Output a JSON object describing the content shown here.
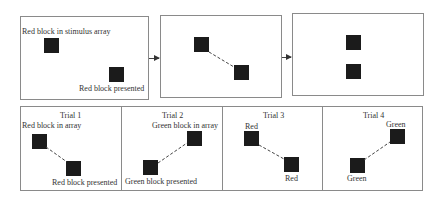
{
  "top_row": {
    "panels": [
      {
        "id": "stimulus-array",
        "labels": [
          "Red block in stimulus array",
          "Red block presented"
        ]
      },
      {
        "id": "connected-pair",
        "labels": []
      },
      {
        "id": "vertical-pair",
        "labels": []
      }
    ]
  },
  "trials": [
    {
      "title": "Trial 1",
      "array_label": "Red block in array",
      "presented_label": "Red block presented"
    },
    {
      "title": "Trial 2",
      "array_label": "Green block in array",
      "presented_label": "Green block presented"
    },
    {
      "title": "Trial 3",
      "array_label": "Red",
      "presented_label": "Red"
    },
    {
      "title": "Trial 4",
      "array_label": "Green",
      "presented_label": "Green"
    }
  ],
  "colors": {
    "block": "#1b1b1b",
    "border": "#8a8a8a",
    "line": "#444444"
  }
}
